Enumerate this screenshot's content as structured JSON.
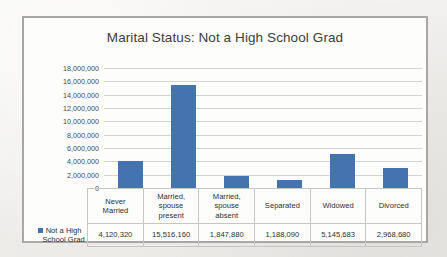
{
  "chart_data": {
    "type": "bar",
    "title": "Marital Status: Not a High School Grad",
    "xlabel": "",
    "ylabel": "",
    "categories": [
      "Never Married",
      "Married, spouse present",
      "Married, spouse absent",
      "Separated",
      "Widowed",
      "Divorced"
    ],
    "category_lines": [
      [
        "Never",
        "Married"
      ],
      [
        "Married,",
        "spouse",
        "present"
      ],
      [
        "Married,",
        "spouse",
        "absent"
      ],
      [
        "Separated"
      ],
      [
        "Widowed"
      ],
      [
        "Divorced"
      ]
    ],
    "series": [
      {
        "name": "Not a High School Grad",
        "values": [
          4120320,
          15516160,
          1847880,
          1188090,
          5145683,
          2968680
        ],
        "value_labels": [
          "4,120,320",
          "15,516,160",
          "1,847,880",
          "1,188,090",
          "5,145,683",
          "2,968,680"
        ],
        "color": "#4573b0"
      }
    ],
    "ylim": [
      0,
      18000000
    ],
    "ytick_values": [
      18000000,
      16000000,
      14000000,
      12000000,
      10000000,
      8000000,
      6000000,
      4000000,
      2000000,
      0
    ],
    "ytick_labels": [
      "18,000,000",
      "16,000,000",
      "14,000,000",
      "12,000,000",
      "10,000,000",
      "8,000,000",
      "6,000,000",
      "4,000,000",
      "2,000,000",
      "0"
    ],
    "grid": true,
    "legend_position": "data-table-row",
    "data_table_visible": true
  },
  "legend": {
    "marker_color": "#4573b0",
    "line1": "Not a High",
    "line2": "School Grad"
  },
  "colors": {
    "bar": "#4573b0",
    "gridline": "#d2d2d2",
    "frame_border": "#a7a7a5",
    "chart_background": "#fdfdfc",
    "page_background": "#f2f1ef",
    "text": "#3c3c3c"
  }
}
